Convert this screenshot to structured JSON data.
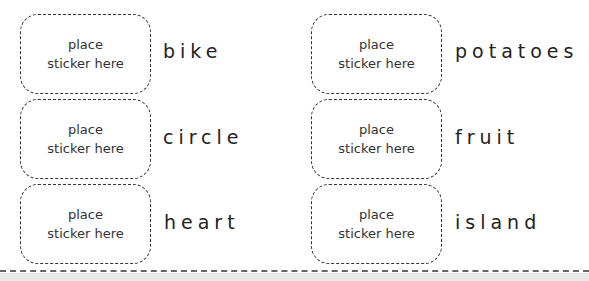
{
  "stickers": {
    "line1": "place",
    "line2": "sticker here"
  },
  "left_column": [
    {
      "word": "bike"
    },
    {
      "word": "circle"
    },
    {
      "word": "heart"
    }
  ],
  "right_column": [
    {
      "word": "potatoes"
    },
    {
      "word": "fruit"
    },
    {
      "word": "island"
    }
  ]
}
